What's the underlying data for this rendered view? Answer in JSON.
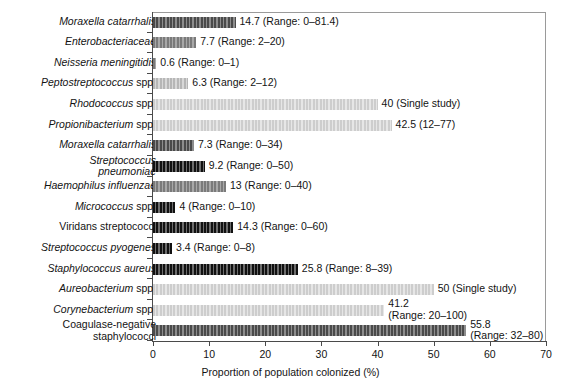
{
  "chart_data": {
    "type": "bar",
    "orientation": "horizontal",
    "title": "",
    "xlabel": "Proportion of population colonized (%)",
    "ylabel": "",
    "xlim": [
      0,
      70
    ],
    "xticks": [
      0,
      10,
      20,
      30,
      40,
      50,
      60,
      70
    ],
    "grid": false,
    "legend": null,
    "categories": [
      "Moraxella catarrhalis",
      "Enterobacteriaceae",
      "Neisseria meningitidis",
      "Peptostreptococcus spp.",
      "Rhodococcus spp.",
      "Propionibacterium spp.",
      "Moraxella catarrhalis",
      "Streptococcus pneumoniae",
      "Haemophilus influenzae",
      "Micrococcus spp.",
      "Viridans streptococci",
      "Streptococcus pyogenes",
      "Staphylococcus aureus",
      "Aureobacterium spp.",
      "Corynebacterium spp.",
      "Coagulase-negative staphylococci"
    ],
    "values": [
      14.7,
      7.7,
      0.6,
      6.3,
      40,
      42.5,
      7.3,
      9.2,
      13,
      4,
      14.3,
      3.4,
      25.8,
      50,
      41.2,
      55.8
    ],
    "annotations": [
      "14.7 (Range: 0–81.4)",
      "7.7 (Range: 2–20)",
      "0.6 (Range: 0–1)",
      "6.3 (Range: 2–12)",
      "40 (Single study)",
      "42.5 (12–77)",
      "7.3 (Range: 0–34)",
      "9.2 (Range: 0–50)",
      "13 (Range: 0–40)",
      "4 (Range: 0–10)",
      "14.3 (Range: 0–60)",
      "3.4 (Range: 0–8)",
      "25.8 (Range: 8–39)",
      "50 (Single study)",
      "41.2 (Range: 20–100)",
      "55.8 (Range: 32–80)"
    ]
  },
  "rows": [
    {
      "label_l1": "Moraxella catarrhalis",
      "label_l2": "",
      "italic": true,
      "roman_tail": "",
      "value": 14.7,
      "annot_l1": "14.7 (Range: 0–81.4)",
      "annot_l2": "",
      "shade": "d2"
    },
    {
      "label_l1": "Enterobacteriaceae",
      "label_l2": "",
      "italic": true,
      "roman_tail": "",
      "value": 7.7,
      "annot_l1": "7.7 (Range: 2–20)",
      "annot_l2": "",
      "shade": "d3"
    },
    {
      "label_l1": "Neisseria meningitidis",
      "label_l2": "",
      "italic": true,
      "roman_tail": "",
      "value": 0.6,
      "annot_l1": "0.6 (Range: 0–1)",
      "annot_l2": "",
      "shade": "d3"
    },
    {
      "label_l1": "Peptostreptococcus",
      "label_l2": "",
      "italic": true,
      "roman_tail": " spp.",
      "value": 6.3,
      "annot_l1": "6.3 (Range: 2–12)",
      "annot_l2": "",
      "shade": "d4"
    },
    {
      "label_l1": "Rhodococcus",
      "label_l2": "",
      "italic": true,
      "roman_tail": " spp.",
      "value": 40,
      "annot_l1": "40 (Single study)",
      "annot_l2": "",
      "shade": "d5"
    },
    {
      "label_l1": "Propionibacterium",
      "label_l2": "",
      "italic": true,
      "roman_tail": " spp.",
      "value": 42.5,
      "annot_l1": "42.5 (12–77)",
      "annot_l2": "",
      "shade": "d5"
    },
    {
      "label_l1": "Moraxella catarrhalis",
      "label_l2": "",
      "italic": true,
      "roman_tail": "",
      "value": 7.3,
      "annot_l1": "7.3 (Range: 0–34)",
      "annot_l2": "",
      "shade": "d2"
    },
    {
      "label_l1": "Streptococcus",
      "label_l2": "pneumoniae",
      "italic": true,
      "roman_tail": "",
      "value": 9.2,
      "annot_l1": "9.2 (Range: 0–50)",
      "annot_l2": "",
      "shade": "d1"
    },
    {
      "label_l1": "Haemophilus influenzae",
      "label_l2": "",
      "italic": true,
      "roman_tail": "",
      "value": 13,
      "annot_l1": "13 (Range: 0–40)",
      "annot_l2": "",
      "shade": "d3"
    },
    {
      "label_l1": "Micrococcus",
      "label_l2": "",
      "italic": true,
      "roman_tail": " spp.",
      "value": 4,
      "annot_l1": "4 (Range: 0–10)",
      "annot_l2": "",
      "shade": "d1"
    },
    {
      "label_l1": "Viridans streptococci",
      "label_l2": "",
      "italic": false,
      "roman_tail": "",
      "value": 14.3,
      "annot_l1": "14.3 (Range: 0–60)",
      "annot_l2": "",
      "shade": "d1"
    },
    {
      "label_l1": "Streptococcus pyogenes",
      "label_l2": "",
      "italic": true,
      "roman_tail": "",
      "value": 3.4,
      "annot_l1": "3.4 (Range: 0–8)",
      "annot_l2": "",
      "shade": "d1"
    },
    {
      "label_l1": "Staphylococcus aureus",
      "label_l2": "",
      "italic": true,
      "roman_tail": "",
      "value": 25.8,
      "annot_l1": "25.8 (Range: 8–39)",
      "annot_l2": "",
      "shade": "d1"
    },
    {
      "label_l1": "Aureobacterium",
      "label_l2": "",
      "italic": true,
      "roman_tail": " spp.",
      "value": 50,
      "annot_l1": "50 (Single study)",
      "annot_l2": "",
      "shade": "d5"
    },
    {
      "label_l1": "Corynebacterium",
      "label_l2": "",
      "italic": true,
      "roman_tail": " spp.",
      "value": 41.2,
      "annot_l1": "41.2",
      "annot_l2": "(Range: 20–100)",
      "shade": "d5"
    },
    {
      "label_l1": "Coagulase-negative",
      "label_l2": "staphylococci",
      "italic": false,
      "roman_tail": "",
      "value": 55.8,
      "annot_l1": "55.8",
      "annot_l2": "(Range: 32–80)",
      "shade": "d2"
    }
  ],
  "axis": {
    "xlabel": "Proportion of population colonized (%)",
    "ticks": [
      "0",
      "10",
      "20",
      "30",
      "40",
      "50",
      "60",
      "70"
    ]
  },
  "colors": {
    "frame": "#9a9a9a",
    "axis": "#4a4a4a",
    "text": "#131313",
    "background": "#ffffff"
  }
}
